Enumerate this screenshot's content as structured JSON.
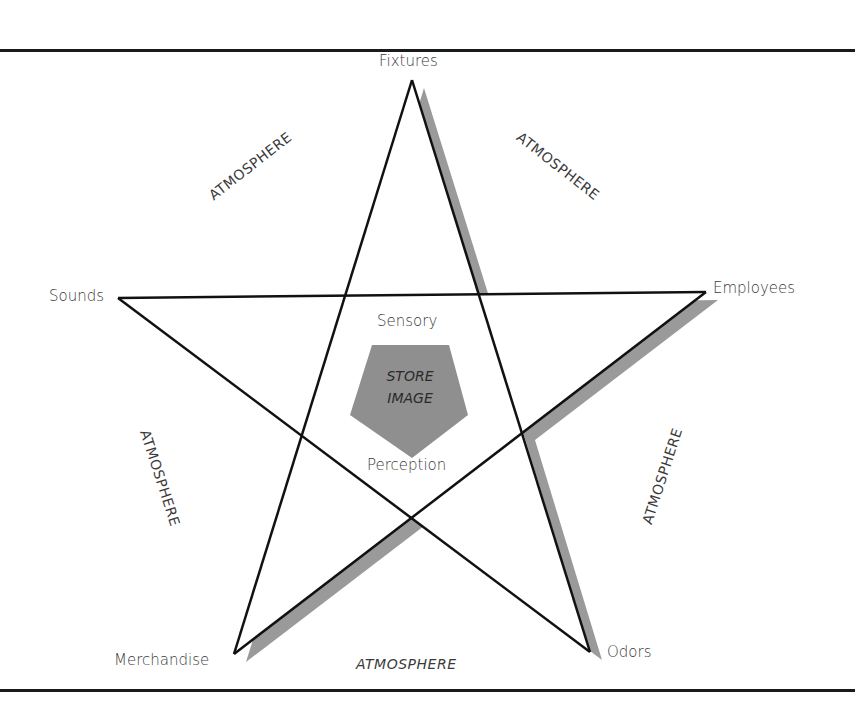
{
  "diagram": {
    "vertices": {
      "top": "Fixtures",
      "right": "Employees",
      "bottom_right": "Odors",
      "bottom_left": "Merchandise",
      "left": "Sounds"
    },
    "inner": {
      "top_label": "Sensory",
      "center_line1": "STORE",
      "center_line2": "IMAGE",
      "bottom_label": "Perception"
    },
    "region_labels": {
      "upper_left": "ATMOSPHERE",
      "upper_right": "ATMOSPHERE",
      "lower_left": "ATMOSPHERE",
      "lower_right": "ATMOSPHERE",
      "bottom": "ATMOSPHERE"
    },
    "colors": {
      "stroke": "#111111",
      "shadow": "#9a9a9a",
      "center_fill": "#8f8f8f",
      "text": "#3a3a3a"
    }
  }
}
